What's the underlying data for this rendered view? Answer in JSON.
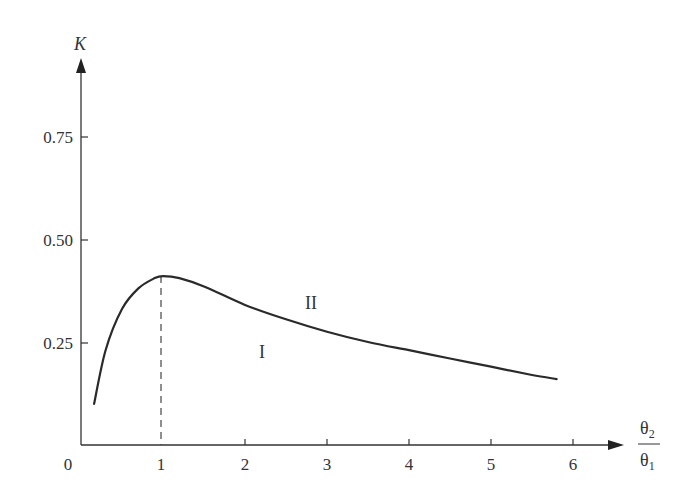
{
  "chart_data": {
    "type": "line",
    "title": "",
    "xlabel": "θ2/θ1",
    "xlabel_num": "θ",
    "xlabel_num_sub": "2",
    "xlabel_den": "θ",
    "xlabel_den_sub": "1",
    "ylabel": "K",
    "xlim": [
      0,
      6.6
    ],
    "ylim": [
      0,
      0.9
    ],
    "grid": false,
    "x_ticks": [
      "0",
      "1",
      "2",
      "3",
      "4",
      "5",
      "6"
    ],
    "y_ticks": [
      "0.25",
      "0.50",
      "0.75"
    ],
    "series": [
      {
        "name": "K(θ2/θ1)",
        "x": [
          0.16,
          0.3,
          0.5,
          0.7,
          0.9,
          1.0,
          1.2,
          1.5,
          2.0,
          2.5,
          3.0,
          3.5,
          4.0,
          4.5,
          5.0,
          5.5,
          5.8
        ],
        "values": [
          0.1,
          0.23,
          0.33,
          0.38,
          0.405,
          0.41,
          0.405,
          0.385,
          0.34,
          0.305,
          0.275,
          0.25,
          0.23,
          0.21,
          0.19,
          0.17,
          0.16
        ]
      }
    ],
    "annotations": [
      {
        "text": "II",
        "x": 2.8,
        "y": 0.34,
        "note": "region above curve"
      },
      {
        "text": "I",
        "x": 2.2,
        "y": 0.22,
        "note": "region below curve"
      },
      {
        "type": "dashed-vertical-line",
        "x": 1.0,
        "from": 0,
        "to": 0.41,
        "note": "marks peak"
      }
    ]
  }
}
